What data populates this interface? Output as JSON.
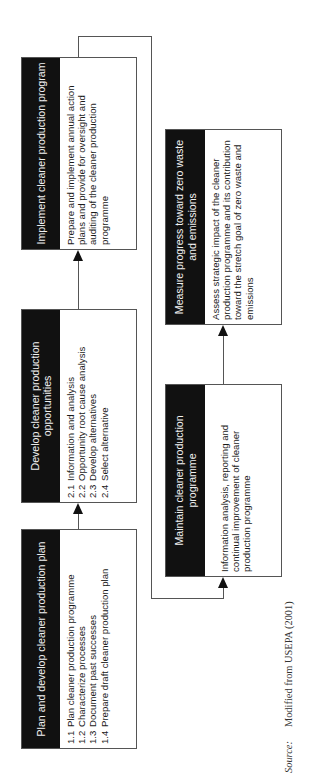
{
  "diagram": {
    "orientation": "rotated -90 degrees",
    "colors": {
      "header_bg": "#111111",
      "header_text": "#f2f2f2",
      "border": "#555555",
      "arrow": "#111111"
    },
    "boxes": [
      {
        "id": 1,
        "title": "Plan and develop cleaner production plan",
        "items": [
          {
            "num": "1.1",
            "text": "Plan cleaner production programme"
          },
          {
            "num": "1.2",
            "text": "Characterize processes"
          },
          {
            "num": "1.3",
            "text": "Document past successes"
          },
          {
            "num": "1.4",
            "text": "Prepare draft cleaner production plan"
          }
        ]
      },
      {
        "id": 2,
        "title": "Develop cleaner production opportunities",
        "items": [
          {
            "num": "2.1",
            "text": "Information and analysis"
          },
          {
            "num": "2.2",
            "text": "Opportunity root cause analysis"
          },
          {
            "num": "2.3",
            "text": "Develop alternatives"
          },
          {
            "num": "2.4",
            "text": "Select alternative"
          }
        ]
      },
      {
        "id": 3,
        "title": "Implement cleaner production program",
        "description": "Prepare and implement annual action plans and provide for oversight and auditing of the cleaner production programme"
      },
      {
        "id": 4,
        "title": "Maintain cleaner production programme",
        "description": "Information analysis, reporting and continual improvement of cleaner production programme"
      },
      {
        "id": 5,
        "title": "Measure progress toward zero waste and emissions",
        "description": "Assess strategic impact of the cleaner production programme and its contribution toward the stretch goal of zero waste and emissions"
      }
    ],
    "flow": [
      "1 -> 2",
      "2 -> 3",
      "3 -> 4",
      "4 -> 5"
    ]
  },
  "source": {
    "label": "Source:",
    "text": "Modified from USEPA (2001)"
  }
}
